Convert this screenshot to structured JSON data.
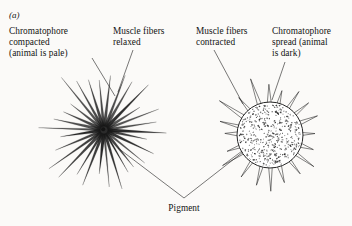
{
  "figure": {
    "panel_letter": "(a)",
    "background_color": "#fbfaf8",
    "ink_color": "#1a1a1a",
    "width": 352,
    "height": 226
  },
  "labels": {
    "chromatophore_compacted": "Chromatophore\ncompacted\n(animal is pale)",
    "muscle_fibers_relaxed": "Muscle fibers\nrelaxed",
    "muscle_fibers_contracted": "Muscle fibers\ncontracted",
    "chromatophore_spread": "Chromatophore\nspread (animal\nis dark)",
    "pigment": "Pigment"
  },
  "diagram": {
    "left_cell": {
      "name": "compacted-chromatophore",
      "center_x": 104,
      "center_y": 130,
      "core_radius": 4,
      "spike_count": 30,
      "spike_length": 62,
      "description": "radiating muscle fibers with compacted dark pigment core"
    },
    "right_cell": {
      "name": "spread-chromatophore",
      "center_x": 270,
      "center_y": 135,
      "body_radius": 33,
      "spike_count": 20,
      "spike_length": 22,
      "stipple_count": 430,
      "description": "stippled disc of dispersed pigment with short contracted muscle fibers"
    },
    "leaders": {
      "pigment_apex_x": 184,
      "pigment_apex_y": 198,
      "pigment_left_target_x": 118,
      "pigment_left_target_y": 148,
      "pigment_right_target_x": 243,
      "pigment_right_target_y": 152
    }
  }
}
